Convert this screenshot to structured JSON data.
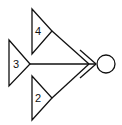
{
  "diagram": {
    "type": "feynman-like-vertex",
    "stroke_color": "#111111",
    "background": "#ffffff",
    "triangles": [
      {
        "label": "4",
        "points": [
          [
            32,
            9
          ],
          [
            52,
            31
          ],
          [
            32,
            54
          ]
        ],
        "label_pos": [
          38,
          31
        ]
      },
      {
        "label": "3",
        "points": [
          [
            9,
            40
          ],
          [
            30,
            64
          ],
          [
            9,
            86
          ]
        ],
        "label_pos": [
          16,
          64
        ]
      },
      {
        "label": "2",
        "points": [
          [
            32,
            76
          ],
          [
            52,
            98
          ],
          [
            32,
            120
          ]
        ],
        "label_pos": [
          38,
          98
        ]
      }
    ],
    "lines": [
      {
        "name": "line-from-4",
        "from": [
          52,
          31
        ],
        "to": [
          89,
          64
        ]
      },
      {
        "name": "line-from-3",
        "from": [
          30,
          64
        ],
        "to": [
          96,
          64
        ]
      },
      {
        "name": "line-from-2",
        "from": [
          52,
          98
        ],
        "to": [
          89,
          64
        ]
      },
      {
        "name": "chevron-upper",
        "from": [
          80,
          50
        ],
        "to": [
          96,
          64
        ]
      },
      {
        "name": "chevron-lower",
        "from": [
          80,
          78
        ],
        "to": [
          96,
          64
        ]
      }
    ],
    "circle": {
      "cx": 106,
      "cy": 64,
      "r": 9
    }
  }
}
